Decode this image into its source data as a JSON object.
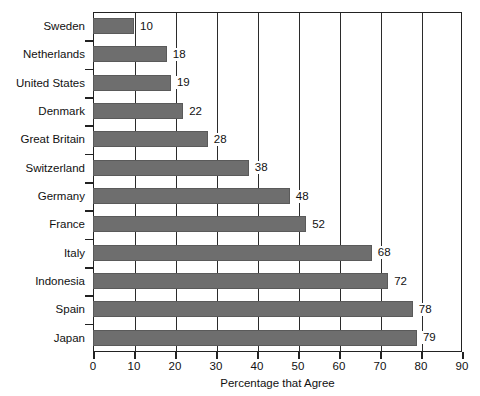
{
  "chart_data": {
    "type": "bar",
    "orientation": "horizontal",
    "title": "",
    "xlabel": "Percentage that Agree",
    "ylabel": "",
    "xlim": [
      0,
      90
    ],
    "xticks": [
      0,
      10,
      20,
      30,
      40,
      50,
      60,
      70,
      80,
      90
    ],
    "grid": true,
    "grid_axis": "x",
    "legend": null,
    "bar_color": "#6e6e6e",
    "show_values": true,
    "categories": [
      "Sweden",
      "Netherlands",
      "United States",
      "Denmark",
      "Great Britain",
      "Switzerland",
      "Germany",
      "France",
      "Italy",
      "Indonesia",
      "Spain",
      "Japan"
    ],
    "values": [
      10,
      18,
      19,
      22,
      28,
      38,
      48,
      52,
      68,
      72,
      78,
      79
    ]
  }
}
